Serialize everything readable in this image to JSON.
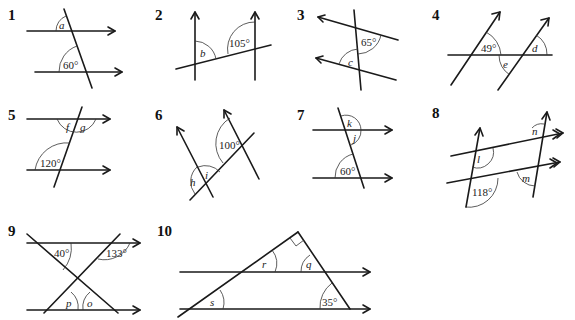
{
  "diagrams": [
    {
      "number": "1",
      "unknowns": [
        "a"
      ],
      "given": [
        "60°"
      ]
    },
    {
      "number": "2",
      "unknowns": [
        "b"
      ],
      "given": [
        "105°"
      ]
    },
    {
      "number": "3",
      "unknowns": [
        "c"
      ],
      "given": [
        "65°"
      ]
    },
    {
      "number": "4",
      "unknowns": [
        "d",
        "e"
      ],
      "given": [
        "49°"
      ]
    },
    {
      "number": "5",
      "unknowns": [
        "f",
        "g"
      ],
      "given": [
        "120°"
      ]
    },
    {
      "number": "6",
      "unknowns": [
        "h",
        "i"
      ],
      "given": [
        "100°"
      ]
    },
    {
      "number": "7",
      "unknowns": [
        "k",
        "j"
      ],
      "given": [
        "60°"
      ]
    },
    {
      "number": "8",
      "unknowns": [
        "l",
        "n",
        "m"
      ],
      "given": [
        "118°"
      ]
    },
    {
      "number": "9",
      "unknowns": [
        "p",
        "o"
      ],
      "given": [
        "40°",
        "133°"
      ]
    },
    {
      "number": "10",
      "unknowns": [
        "r",
        "q",
        "s"
      ],
      "given": [
        "35°"
      ]
    }
  ]
}
